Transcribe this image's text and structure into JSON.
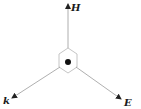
{
  "diagram": {
    "type": "vector-diagram",
    "colors": {
      "line": "#9a9a9a",
      "arrowhead": "#222222",
      "dot": "#111111",
      "label": "#1a1a1a"
    },
    "center": {
      "x": 68,
      "y": 62
    },
    "vectors": [
      {
        "id": "H",
        "label": "H",
        "from": [
          68,
          48
        ],
        "to": [
          68,
          4
        ],
        "label_pos": [
          71,
          11
        ]
      },
      {
        "id": "k",
        "label": "k",
        "from": [
          60,
          67
        ],
        "to": [
          12,
          98
        ],
        "label_pos": [
          3,
          104
        ]
      },
      {
        "id": "E",
        "label": "E",
        "from": [
          76,
          67
        ],
        "to": [
          121,
          99
        ],
        "label_pos": [
          124,
          106
        ]
      }
    ],
    "hexagon": {
      "points": "68,48 77,54 77,67 68,73 59,67 59,54"
    }
  }
}
